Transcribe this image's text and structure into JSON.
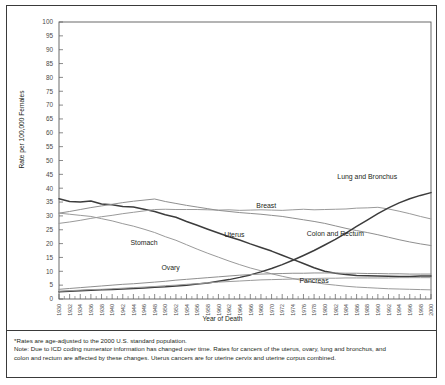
{
  "chart_data": {
    "type": "line",
    "title": "",
    "xlabel": "Year of Death",
    "ylabel": "Rate per 100,000 Females",
    "xlim": [
      1930,
      2000
    ],
    "ylim": [
      0,
      100
    ],
    "ytick_step": 5,
    "xtick_step": 2,
    "grid": false,
    "legend_position": "inline-annotations",
    "yticks": [
      0,
      5,
      10,
      15,
      20,
      25,
      30,
      35,
      40,
      45,
      50,
      55,
      60,
      65,
      70,
      75,
      80,
      85,
      90,
      95,
      100
    ],
    "xticks": [
      1930,
      1932,
      1934,
      1936,
      1938,
      1940,
      1942,
      1944,
      1946,
      1948,
      1950,
      1952,
      1954,
      1956,
      1958,
      1960,
      1962,
      1964,
      1966,
      1968,
      1970,
      1972,
      1974,
      1976,
      1978,
      1980,
      1982,
      1984,
      1986,
      1988,
      1990,
      1992,
      1994,
      1996,
      1998,
      2000
    ],
    "x": [
      1930,
      1932,
      1934,
      1936,
      1938,
      1940,
      1942,
      1944,
      1946,
      1948,
      1950,
      1952,
      1954,
      1956,
      1958,
      1960,
      1962,
      1964,
      1966,
      1968,
      1970,
      1972,
      1974,
      1976,
      1978,
      1980,
      1982,
      1984,
      1986,
      1988,
      1990,
      1992,
      1994,
      1996,
      1998,
      2000
    ],
    "series": [
      {
        "name": "Uterus",
        "color": "#3c3c3c",
        "label_x": 1963,
        "label_y": 22.5,
        "values": [
          36.2,
          35.2,
          35.0,
          35.4,
          34.3,
          34.0,
          33.4,
          33.2,
          32.4,
          31.6,
          30.4,
          29.5,
          28.0,
          26.6,
          25.2,
          23.8,
          22.5,
          21.3,
          19.9,
          18.6,
          17.3,
          15.8,
          14.3,
          12.8,
          11.3,
          10.0,
          9.3,
          8.8,
          8.5,
          8.4,
          8.3,
          8.2,
          8.1,
          8.1,
          8.3,
          8.3
        ]
      },
      {
        "name": "Stomach",
        "color": "#9a9a9a",
        "label_x": 1946,
        "label_y": 19.5,
        "values": [
          31.0,
          30.6,
          30.2,
          29.8,
          29.0,
          28.2,
          27.2,
          26.3,
          25.2,
          24.0,
          22.5,
          21.2,
          19.6,
          18.0,
          16.5,
          15.1,
          13.7,
          12.4,
          11.2,
          10.2,
          9.1,
          8.2,
          7.4,
          6.6,
          6.0,
          5.4,
          5.0,
          4.6,
          4.3,
          4.1,
          3.9,
          3.7,
          3.6,
          3.5,
          3.4,
          3.3
        ]
      },
      {
        "name": "Breast",
        "color": "#9a9a9a",
        "label_x": 1969,
        "label_y": 33.0,
        "values": [
          27.3,
          27.8,
          28.4,
          29.1,
          29.7,
          30.2,
          30.8,
          31.3,
          31.8,
          32.3,
          32.4,
          32.3,
          32.3,
          32.3,
          32.2,
          32.1,
          32.2,
          32.0,
          32.1,
          32.2,
          32.1,
          32.0,
          32.2,
          32.4,
          32.2,
          32.3,
          32.4,
          32.5,
          32.8,
          32.9,
          33.1,
          32.5,
          31.7,
          30.8,
          29.8,
          28.9
        ]
      },
      {
        "name": "Colon and Rectum",
        "color": "#8f8f8f",
        "label_x": 1982,
        "label_y": 22.6,
        "values": [
          31.0,
          31.6,
          32.3,
          33.0,
          33.6,
          34.2,
          34.8,
          35.3,
          35.7,
          36.1,
          35.2,
          34.5,
          33.8,
          33.2,
          32.6,
          32.0,
          31.6,
          31.2,
          30.9,
          30.6,
          30.2,
          29.8,
          29.2,
          28.6,
          28.0,
          27.3,
          26.4,
          25.5,
          24.7,
          24.0,
          23.2,
          22.3,
          21.4,
          20.6,
          19.9,
          19.3
        ]
      },
      {
        "name": "Lung and Bronchus",
        "color": "#3c3c3c",
        "label_x": 1988,
        "label_y": 43.5,
        "values": [
          2.6,
          2.8,
          3.0,
          3.2,
          3.3,
          3.4,
          3.6,
          3.8,
          4.0,
          4.2,
          4.4,
          4.7,
          5.0,
          5.4,
          5.8,
          6.4,
          7.0,
          7.8,
          8.7,
          9.8,
          11.0,
          12.4,
          14.0,
          15.7,
          17.5,
          19.5,
          21.5,
          23.8,
          26.2,
          28.5,
          30.8,
          32.9,
          34.7,
          36.2,
          37.4,
          38.4
        ]
      },
      {
        "name": "Ovary",
        "color": "#8f8f8f",
        "label_x": 1951,
        "label_y": 10.3,
        "values": [
          3.5,
          3.8,
          4.1,
          4.4,
          4.7,
          5.0,
          5.3,
          5.5,
          5.8,
          6.1,
          6.4,
          6.8,
          7.1,
          7.4,
          7.7,
          8.0,
          8.3,
          8.6,
          8.8,
          9.0,
          9.1,
          9.2,
          9.3,
          9.3,
          9.4,
          9.4,
          9.4,
          9.3,
          9.3,
          9.2,
          9.2,
          9.1,
          9.1,
          9.0,
          9.0,
          9.0
        ]
      },
      {
        "name": "Pancreas",
        "color": "#9a9a9a",
        "label_x": 1978,
        "label_y": 5.8,
        "values": [
          2.8,
          3.0,
          3.2,
          3.4,
          3.5,
          3.7,
          3.9,
          4.1,
          4.3,
          4.5,
          4.8,
          5.0,
          5.3,
          5.5,
          5.8,
          6.1,
          6.3,
          6.5,
          6.7,
          6.9,
          7.0,
          7.1,
          7.2,
          7.3,
          7.4,
          7.5,
          7.5,
          7.6,
          7.6,
          7.6,
          7.6,
          7.6,
          7.7,
          7.7,
          7.7,
          7.7
        ]
      }
    ]
  },
  "notes": {
    "line1": "*Rates are age-adjusted to the 2000 U.S. standard population.",
    "line2": "Note: Due to ICD coding numerator information has changed over time. Rates for cancers of the uterus, ovary, lung and bronchus, and",
    "line3": "colon and rectum are affected by these changes. Uterus cancers are for uterine cervix and uterine corpus combined."
  }
}
